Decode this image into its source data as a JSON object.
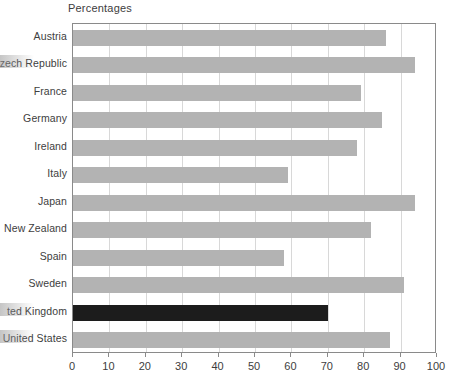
{
  "chart_data": {
    "type": "bar",
    "orientation": "horizontal",
    "title": "Percentages",
    "xlabel": "",
    "ylabel": "",
    "xlim": [
      0,
      100
    ],
    "grid": true,
    "legend": "none",
    "xticks": [
      0,
      10,
      20,
      30,
      40,
      50,
      60,
      70,
      80,
      90,
      100
    ],
    "categories": [
      "Austria",
      "zech Republic",
      "France",
      "Germany",
      "Ireland",
      "Italy",
      "Japan",
      "New Zealand",
      "Spain",
      "Sweden",
      "ted Kingdom",
      "United States"
    ],
    "values": [
      86,
      94,
      79,
      85,
      78,
      59,
      94,
      82,
      58,
      91,
      70,
      87
    ],
    "highlight_category": "ted Kingdom",
    "colors": {
      "bar": "#b3b3b3",
      "highlight": "#1c1c1c",
      "grid": "#d8d8d8",
      "frame": "#8a8a8a",
      "text": "#3d3d3d",
      "background": "#ffffff"
    }
  }
}
